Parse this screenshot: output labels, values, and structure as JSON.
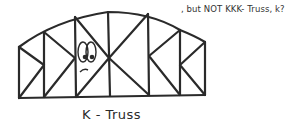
{
  "figure": {
    "type": "hand-drawn sketch",
    "caption": "K - Truss",
    "annotation": ", but NOT KKK- Truss, k?",
    "colors": {
      "ink": "#2a2a2a",
      "background": "#ffffff"
    }
  }
}
